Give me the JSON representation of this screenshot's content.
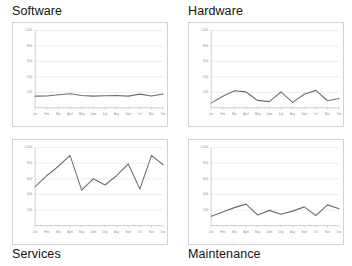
{
  "panels": [
    {
      "title": "Software",
      "title_position": "top",
      "chart_data": {
        "type": "line",
        "title": "Software",
        "xlabel": "",
        "ylabel": "",
        "categories": [
          "Jan",
          "Feb",
          "Mar",
          "April",
          "May",
          "June",
          "July",
          "Aug",
          "Sept",
          "Oct",
          "Nov",
          "Dec"
        ],
        "values": [
          150,
          152,
          168,
          182,
          158,
          150,
          156,
          158,
          150,
          176,
          152,
          178
        ],
        "ylim": [
          0,
          1000
        ],
        "yticks": [
          0,
          200,
          400,
          600,
          800,
          1000
        ],
        "ytick_labels": [
          "-",
          "200",
          "400",
          "600",
          "800",
          "1,000"
        ],
        "grid": true,
        "legend": "none"
      }
    },
    {
      "title": "Hardware",
      "title_position": "top",
      "chart_data": {
        "type": "line",
        "title": "Hardware",
        "xlabel": "",
        "ylabel": "",
        "categories": [
          "Jan",
          "Feb",
          "Mar",
          "April",
          "May",
          "June",
          "July",
          "Aug",
          "Sept",
          "Oct",
          "Nov",
          "Dec"
        ],
        "values": [
          60,
          150,
          220,
          205,
          95,
          80,
          205,
          70,
          175,
          225,
          90,
          120,
          230
        ],
        "ylim": [
          0,
          1000
        ],
        "yticks": [
          0,
          200,
          400,
          600,
          800,
          1000
        ],
        "ytick_labels": [
          "-",
          "200",
          "400",
          "600",
          "800",
          "1,000"
        ],
        "grid": true,
        "legend": "none"
      }
    },
    {
      "title": "Services",
      "title_position": "bottom",
      "chart_data": {
        "type": "line",
        "title": "Services",
        "xlabel": "",
        "ylabel": "",
        "categories": [
          "Jan",
          "Feb",
          "Mar",
          "April",
          "May",
          "June",
          "July",
          "Aug",
          "Sept",
          "Oct",
          "Nov",
          "Dec"
        ],
        "values": [
          500,
          640,
          760,
          900,
          455,
          600,
          520,
          640,
          790,
          470,
          900,
          780
        ],
        "ylim": [
          0,
          1000
        ],
        "yticks": [
          0,
          200,
          400,
          600,
          800,
          1000
        ],
        "ytick_labels": [
          "-",
          "200",
          "400",
          "600",
          "800",
          "1,000"
        ],
        "grid": true,
        "legend": "none"
      }
    },
    {
      "title": "Maintenance",
      "title_position": "bottom",
      "chart_data": {
        "type": "line",
        "title": "Maintenance",
        "xlabel": "",
        "ylabel": "",
        "categories": [
          "Jan",
          "Feb",
          "Mar",
          "April",
          "May",
          "June",
          "July",
          "Aug",
          "Sept",
          "Oct",
          "Nov",
          "Dec"
        ],
        "values": [
          120,
          175,
          230,
          275,
          135,
          195,
          145,
          185,
          240,
          130,
          265,
          215
        ],
        "ylim": [
          0,
          1000
        ],
        "yticks": [
          0,
          200,
          400,
          600,
          800,
          1000
        ],
        "ytick_labels": [
          "-",
          "200",
          "400",
          "600",
          "800",
          "1,000"
        ],
        "grid": true,
        "legend": "none"
      }
    }
  ],
  "colors": {
    "series_line": "#6b6b6b",
    "gridline": "#e2e2e2",
    "panel_border": "#d2d2d2",
    "axis": "#b9b9b9",
    "tick_text": "#8d8d8d",
    "title_text": "#131313",
    "background": "#ffffff"
  }
}
